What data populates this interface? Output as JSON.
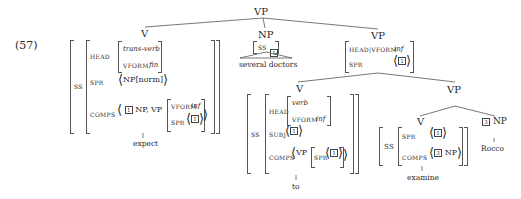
{
  "example_number": "(57)",
  "root": {
    "label": "VP"
  },
  "verb_expect": {
    "label": "V",
    "ss": "SS",
    "head": "HEAD",
    "head_type": "trans-verb",
    "vform": "VFORM",
    "vform_value": "fin",
    "spr": "SPR",
    "spr_value": "NP[norm]",
    "comps": "COMPS",
    "comps_tag1": "1",
    "comps_np": "NP,",
    "comps_vp": "VP",
    "comps_vp_vform": "VFORM",
    "comps_vp_vform_value": "inf",
    "comps_vp_spr": "SPR",
    "comps_vp_spr_tag": "1",
    "word": "expect"
  },
  "np_subject": {
    "label": "NP",
    "ss": "SS",
    "tag": "1",
    "word": "several doctors"
  },
  "vp_inf": {
    "label": "VP",
    "head_vform": "HEAD|VFORM",
    "head_vform_value": "inf",
    "spr": "SPR",
    "spr_tag": "1"
  },
  "verb_to": {
    "label": "V",
    "ss": "SS",
    "head": "HEAD",
    "head_type": "verb",
    "vform": "VFORM",
    "vform_value": "inf",
    "subj": "SUBJ",
    "subj_tag": "1",
    "comps": "COMPS",
    "comps_vp": "VP",
    "comps_vp_spr": "SPR",
    "comps_vp_spr_tag": "1",
    "word": "to"
  },
  "vp_lower": {
    "label": "VP"
  },
  "verb_examine": {
    "label": "V",
    "ss": "SS",
    "spr": "SPR",
    "spr_tag": "1",
    "comps": "COMPS",
    "comps_tag": "3",
    "comps_np": "NP",
    "word": "examine"
  },
  "np_object": {
    "tag": "3",
    "label": "NP",
    "word": "Rocco"
  }
}
